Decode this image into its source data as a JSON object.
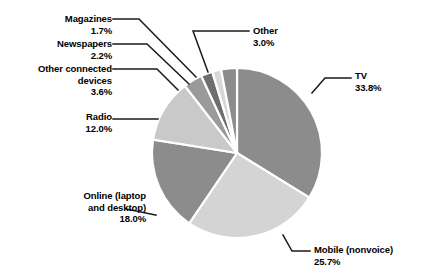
{
  "chart_data": {
    "type": "pie",
    "title": "",
    "subtitle": "",
    "legend_position": "callout-labels",
    "grid": false,
    "unit": "%",
    "categories": [
      "TV",
      "Mobile (nonvoice)",
      "Online (laptop and desktop)",
      "Radio",
      "Other connected devices",
      "Newspapers",
      "Magazines",
      "Other"
    ],
    "values": [
      33.8,
      25.7,
      18.0,
      12.0,
      3.6,
      2.2,
      1.7,
      3.0
    ],
    "slices": [
      {
        "label": "TV",
        "value": 33.8,
        "value_text": "33.8%",
        "color": "#8c8c8c"
      },
      {
        "label": "Mobile (nonvoice)",
        "value": 25.7,
        "value_text": "25.7%",
        "color": "#d4d4d4"
      },
      {
        "label": "Online (laptop and desktop)",
        "value": 18.0,
        "value_text": "18.0%",
        "color": "#8c8c8c"
      },
      {
        "label": "Radio",
        "value": 12.0,
        "value_text": "12.0%",
        "color": "#c9c9c9"
      },
      {
        "label": "Other connected devices",
        "value": 3.6,
        "value_text": "3.6%",
        "color": "#9a9a9a"
      },
      {
        "label": "Newspapers",
        "value": 2.2,
        "value_text": "2.2%",
        "color": "#6e6e6e"
      },
      {
        "label": "Magazines",
        "value": 1.7,
        "value_text": "1.7%",
        "color": "#d8d8d8"
      },
      {
        "label": "Other",
        "value": 3.0,
        "value_text": "3.0%",
        "color": "#8c8c8c"
      }
    ]
  },
  "labels": {
    "magazines": {
      "name": "Magazines",
      "value": "1.7%"
    },
    "newspapers": {
      "name": "Newspapers",
      "value": "2.2%"
    },
    "otherdev": {
      "name": "Other connected",
      "name2": "devices",
      "value": "3.6%"
    },
    "radio": {
      "name": "Radio",
      "value": "12.0%"
    },
    "online": {
      "name": "Online (laptop",
      "name2": "and desktop)",
      "value": "18.0%"
    },
    "other": {
      "name": "Other",
      "value": "3.0%"
    },
    "tv": {
      "name": "TV",
      "value": "33.8%"
    },
    "mobile": {
      "name": "Mobile (nonvoice)",
      "value": "25.7%"
    }
  },
  "colors": {
    "background": "#ffffff",
    "text": "#000000",
    "leader_line": "#1a1a1a",
    "slice_gap": "#ffffff"
  }
}
